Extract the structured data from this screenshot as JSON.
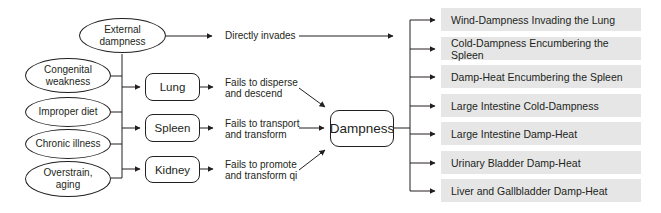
{
  "diagram": {
    "type": "flowchart",
    "causes": [
      {
        "id": "external",
        "label": "External dampness"
      },
      {
        "id": "congenital",
        "label": "Congenital weakness"
      },
      {
        "id": "diet",
        "label": "Improper diet"
      },
      {
        "id": "chronic",
        "label": "Chronic illness"
      },
      {
        "id": "overstrain",
        "label": "Overstrain, aging"
      }
    ],
    "direct_path_label": "Directly invades",
    "organs": [
      {
        "id": "lung",
        "label": "Lung",
        "dysfunction": "Fails to disperse and descend"
      },
      {
        "id": "spleen",
        "label": "Spleen",
        "dysfunction": "Fails to transport and transform"
      },
      {
        "id": "kidney",
        "label": "Kidney",
        "dysfunction": "Fails to promote and transform qi"
      }
    ],
    "central_node": "Dampness",
    "outcomes": [
      "Wind-Dampness Invading the Lung",
      "Cold-Dampness Encumbering the Spleen",
      "Damp-Heat Encumbering the Spleen",
      "Large Intestine Cold-Dampness",
      "Large Intestine Damp-Heat",
      "Urinary Bladder Damp-Heat",
      "Liver and Gallbladder Damp-Heat"
    ],
    "colors": {
      "line": "#231f20",
      "outcome_fill": "#e6e6e7"
    }
  },
  "text": {
    "external_l1": "External",
    "external_l2": "dampness",
    "congenital_l1": "Congenital",
    "congenital_l2": "weakness",
    "diet": "Improper diet",
    "chronic": "Chronic illness",
    "overstrain_l1": "Overstrain,",
    "overstrain_l2": "aging",
    "lung_l1": "Fails to disperse",
    "lung_l2": "and descend",
    "spleen_l1": "Fails to transport",
    "spleen_l2": "and transform",
    "kidney_l1": "Fails to promote",
    "kidney_l2": "and transform qi"
  }
}
